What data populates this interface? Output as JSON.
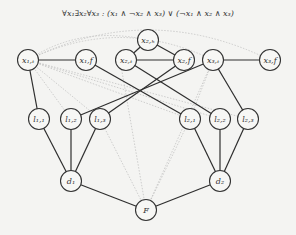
{
  "formula": "∀x₁∃x₂∀x₃ : (x₁ ∧ ¬x₂ ∧ x₃) ∨ (¬x₁ ∧ x₂ ∧ x₃)",
  "nodes": [
    {
      "id": "x1t",
      "label": "x₁,ₜ",
      "x": 28,
      "y": 60
    },
    {
      "id": "x1f",
      "label": "x₁,f",
      "x": 86,
      "y": 60
    },
    {
      "id": "x2h",
      "label": "x₂,ₕ",
      "x": 148,
      "y": 40
    },
    {
      "id": "x2t",
      "label": "x₂,ₜ",
      "x": 126,
      "y": 60
    },
    {
      "id": "x2f",
      "label": "x₂,f",
      "x": 184,
      "y": 60
    },
    {
      "id": "x3t",
      "label": "x₃,ₜ",
      "x": 213,
      "y": 60
    },
    {
      "id": "x3f",
      "label": "x₃,f",
      "x": 270,
      "y": 60
    },
    {
      "id": "l11",
      "label": "l₁,₁",
      "x": 39,
      "y": 119
    },
    {
      "id": "l12",
      "label": "l₁,₂",
      "x": 71,
      "y": 119
    },
    {
      "id": "l13",
      "label": "l₁,₃",
      "x": 100,
      "y": 119
    },
    {
      "id": "l21",
      "label": "l₂,₁",
      "x": 190,
      "y": 119
    },
    {
      "id": "l22",
      "label": "l₂,₂",
      "x": 220,
      "y": 119
    },
    {
      "id": "l23",
      "label": "l₂,₃",
      "x": 248,
      "y": 119
    },
    {
      "id": "d1",
      "label": "d₁",
      "x": 71,
      "y": 181
    },
    {
      "id": "d2",
      "label": "d₂",
      "x": 220,
      "y": 181
    },
    {
      "id": "F",
      "label": "F",
      "x": 146,
      "y": 210
    }
  ],
  "edges": [
    [
      "x1t",
      "x1f"
    ],
    [
      "x2t",
      "x2f"
    ],
    [
      "x3t",
      "x3f"
    ],
    [
      "x2h",
      "x2t"
    ],
    [
      "x2h",
      "x2f"
    ],
    [
      "x1t",
      "l11"
    ],
    [
      "x3t",
      "l12"
    ],
    [
      "x2f",
      "l13"
    ],
    [
      "x1f",
      "l21"
    ],
    [
      "x2t",
      "l22"
    ],
    [
      "x3t",
      "l23"
    ],
    [
      "l11",
      "d1"
    ],
    [
      "l12",
      "d1"
    ],
    [
      "l13",
      "d1"
    ],
    [
      "l21",
      "d2"
    ],
    [
      "l22",
      "d2"
    ],
    [
      "l23",
      "d2"
    ],
    [
      "d1",
      "F"
    ],
    [
      "d2",
      "F"
    ]
  ],
  "colors": {
    "node_stroke": "#333333",
    "edge": "#2e2e2e",
    "dotted": "#bbbbbb",
    "background": "#f4f4f2"
  }
}
